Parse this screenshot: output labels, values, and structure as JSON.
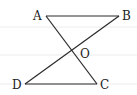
{
  "diagram": {
    "type": "geometry",
    "colors": {
      "line": "#2a2a2a",
      "rule": "#ececec"
    },
    "points": {
      "A": {
        "label": "A",
        "x": 46,
        "y": 16
      },
      "B": {
        "label": "B",
        "x": 119,
        "y": 16
      },
      "C": {
        "label": "C",
        "x": 97,
        "y": 84
      },
      "D": {
        "label": "D",
        "x": 25,
        "y": 84
      },
      "O": {
        "label": "O",
        "x": 71,
        "y": 51
      }
    },
    "segments": [
      "AB",
      "AC",
      "BD",
      "DC"
    ]
  }
}
